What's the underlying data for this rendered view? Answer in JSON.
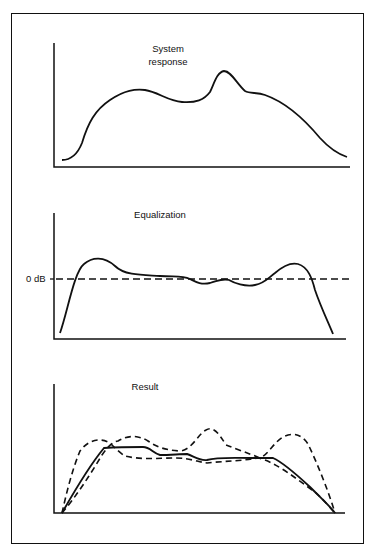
{
  "figure": {
    "panels": [
      {
        "id": "system-response",
        "title": "System\nresponse",
        "axis": {
          "x0": 54,
          "y_top": 43,
          "y_base": 167,
          "x_end": 350
        },
        "curve_path": "M 62 160 C 72 160, 78 153, 82 143 C 88 123, 95 110, 110 100 C 125 90, 135 89, 145 90 C 158 92, 168 101, 182 102 C 196 103, 204 100, 210 92 C 214 84, 217 72, 224 71 C 231 71, 237 84, 245 91 C 250 94, 257 92, 265 95 C 285 102, 305 120, 320 138 C 330 149, 338 154, 347 157"
      },
      {
        "id": "equalization",
        "title": "Equalization",
        "axis": {
          "x0": 54,
          "y_top": 213,
          "y_base": 339,
          "x_end": 346
        },
        "zero_label": "0 dB",
        "zero_y": 279,
        "curve_path": "M 60 333 C 68 310, 74 272, 84 264 C 92 257, 104 256, 115 266 C 125 276, 145 275, 160 276 C 175 277, 182 275, 190 279 C 196 282, 201 285, 210 283 C 218 281, 222 278, 229 280 C 234 283, 245 287, 255 285 C 265 283, 268 278, 275 273 C 283 266, 290 262, 298 264 C 308 267, 312 278, 315 290 C 320 305, 328 322, 333 334"
      },
      {
        "id": "result",
        "title": "Result",
        "axis": {
          "x0": 54,
          "y_top": 384,
          "y_base": 513,
          "x_end": 345
        },
        "solid_path": "M 62 513 C 75 490, 90 465, 104 448 C 120 447, 135 447, 143 447 C 150 447, 153 453, 160 455 C 170 455, 180 454, 187 454 C 195 457, 200 461, 207 460 C 217 457, 235 458, 250 458 C 262 458, 270 458, 273 458 C 282 462, 295 473, 310 487 C 322 499, 330 506, 335 513",
        "dashed_paths": [
          "M 62 513 C 66 495, 72 470, 80 451 C 88 440, 100 437, 110 443 C 115 448, 120 453, 125 456 C 140 460, 160 458, 175 458 C 190 458, 198 462, 207 463 C 225 461, 242 461, 258 458 C 276 462, 295 478, 315 492 C 325 501, 330 508, 335 513",
          "M 62 513 C 75 498, 90 475, 102 455 C 108 446, 114 441, 118 441 C 128 435, 138 435, 148 441 C 156 447, 165 450, 180 451 C 192 450, 198 434, 206 430 C 213 426, 218 432, 226 445 C 236 449, 248 453, 260 458 C 268 455, 274 442, 283 437 C 292 432, 302 434, 308 444 C 318 465, 328 490, 335 513"
        ]
      }
    ]
  },
  "colors": {
    "ink": "#111111",
    "background": "#ffffff"
  }
}
